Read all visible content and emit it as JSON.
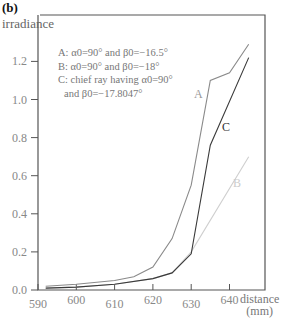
{
  "panel_label": "(b)",
  "chart_data": {
    "type": "line",
    "title": "",
    "xlabel": "distance (mm)",
    "xlabel_lines": [
      "distance",
      "(mm)"
    ],
    "ylabel": "irradiance",
    "xlim": [
      590,
      646
    ],
    "ylim": [
      0.0,
      1.3
    ],
    "xticks": [
      590,
      600,
      610,
      620,
      630,
      640
    ],
    "yticks": [
      "0.0",
      "0.2",
      "0.4",
      "0.6",
      "0.8",
      "1.0",
      "1.2"
    ],
    "grid": false,
    "legend": [
      "A: α0=90° and β0=−16.5°",
      "B: α0=90° and β0=−18°",
      "C: chief ray having α0=90°",
      "and β0=−17.8047°"
    ],
    "series": [
      {
        "name": "A",
        "color": "#8a8a8a",
        "x": [
          592,
          600,
          610,
          615,
          620,
          625,
          630,
          635,
          640,
          645
        ],
        "y": [
          0.02,
          0.03,
          0.05,
          0.07,
          0.12,
          0.27,
          0.55,
          1.1,
          1.14,
          1.29
        ]
      },
      {
        "name": "B",
        "color": "#cfcfcf",
        "x": [
          592,
          600,
          610,
          620,
          625,
          630,
          645
        ],
        "y": [
          0.01,
          0.015,
          0.03,
          0.06,
          0.09,
          0.2,
          0.7
        ]
      },
      {
        "name": "C",
        "color": "#3a3a3a",
        "x": [
          592,
          600,
          610,
          620,
          625,
          630,
          635,
          645
        ],
        "y": [
          0.01,
          0.015,
          0.03,
          0.06,
          0.09,
          0.19,
          0.76,
          1.22
        ]
      }
    ]
  }
}
